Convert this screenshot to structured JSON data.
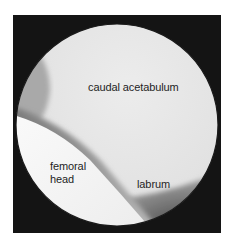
{
  "image": {
    "description": "Arthroscopic circular view of hip joint with anatomical labels",
    "labels": {
      "caudal_acetabulum": "caudal acetabulum",
      "femoral_head_line1": "femoral",
      "femoral_head_line2": "head",
      "labrum": "labrum"
    },
    "colors": {
      "frame": "#141414",
      "acetabulum_surface": "#e6e6e6",
      "femoral_head": "#f6f6f6",
      "shadow_band": "#8a8a8a",
      "labrum_region": "#5a5a5a",
      "text": "#1e1e1e"
    }
  }
}
